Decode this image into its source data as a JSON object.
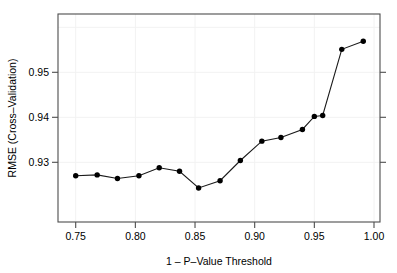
{
  "chart_data": {
    "type": "line",
    "title": "",
    "xlabel": "1 - P-Value Threshold",
    "ylabel": "RMSE (Cross-Validation)",
    "xlim": [
      0.7375,
      1.0005
    ],
    "ylim": [
      0.9205,
      0.9577
    ],
    "xticks": [
      0.75,
      0.8,
      0.85,
      0.9,
      0.95,
      1.0
    ],
    "xtick_labels": [
      "0.75",
      "0.80",
      "0.85",
      "0.90",
      "0.95",
      "1.00"
    ],
    "yticks": [
      0.93,
      0.94,
      0.95
    ],
    "ytick_labels": [
      "0.93",
      "0.94",
      "0.95"
    ],
    "grid": false,
    "legend": null,
    "marker": "filled-circle",
    "x": [
      0.75,
      0.768,
      0.785,
      0.803,
      0.82,
      0.837,
      0.853,
      0.871,
      0.888,
      0.906,
      0.922,
      0.94,
      0.95,
      0.957,
      0.973,
      0.991
    ],
    "values": [
      0.9222,
      0.9228,
      0.9216,
      0.9222,
      0.9241,
      0.9235,
      0.9195,
      0.9212,
      0.9251,
      0.9278,
      0.9281,
      0.9299,
      0.9318,
      0.932,
      0.9496,
      0.952
    ],
    "points": [
      {
        "x": 0.75,
        "y": 0.927
      },
      {
        "x": 0.768,
        "y": 0.9272
      },
      {
        "x": 0.785,
        "y": 0.9264
      },
      {
        "x": 0.803,
        "y": 0.927
      },
      {
        "x": 0.82,
        "y": 0.9288
      },
      {
        "x": 0.837,
        "y": 0.928
      },
      {
        "x": 0.853,
        "y": 0.9243
      },
      {
        "x": 0.871,
        "y": 0.9259
      },
      {
        "x": 0.888,
        "y": 0.9304
      },
      {
        "x": 0.906,
        "y": 0.9347
      },
      {
        "x": 0.922,
        "y": 0.9355
      },
      {
        "x": 0.94,
        "y": 0.9373
      },
      {
        "x": 0.95,
        "y": 0.9402
      },
      {
        "x": 0.957,
        "y": 0.9404
      },
      {
        "x": 0.973,
        "y": 0.9551
      },
      {
        "x": 0.991,
        "y": 0.9569
      }
    ]
  },
  "axes": {
    "x_title": "1 – P–Value Threshold",
    "y_title": "RMSE (Cross–Validation)",
    "x_tick_labels": [
      "0.75",
      "0.80",
      "0.85",
      "0.90",
      "0.95",
      "1.00"
    ],
    "y_tick_labels": [
      "0.93",
      "0.94",
      "0.95"
    ]
  },
  "style": {
    "line_color": "#1a1a1a",
    "marker_color": "#000000",
    "axis_color": "#4d4d4d",
    "background": "#ffffff"
  }
}
